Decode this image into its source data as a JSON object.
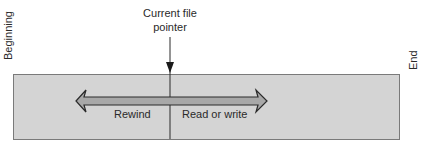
{
  "diagram": {
    "type": "file-pointer-diagram",
    "labels": {
      "beginning": "Beginning",
      "end": "End",
      "pointer_line1": "Current file",
      "pointer_line2": "pointer",
      "rewind": "Rewind",
      "read_write": "Read or write"
    },
    "colors": {
      "file_fill": "#d4d4d4",
      "file_border": "#7a7a7a",
      "arrow_fill": "#a8a8a8",
      "arrow_stroke": "#2a2a2a",
      "pointer_line": "#2a2a2a",
      "text": "#2a2a2a"
    },
    "icons": {
      "pointer_arrow": "arrow-down-icon",
      "direction_arrow": "double-headed-arrow-icon"
    }
  }
}
